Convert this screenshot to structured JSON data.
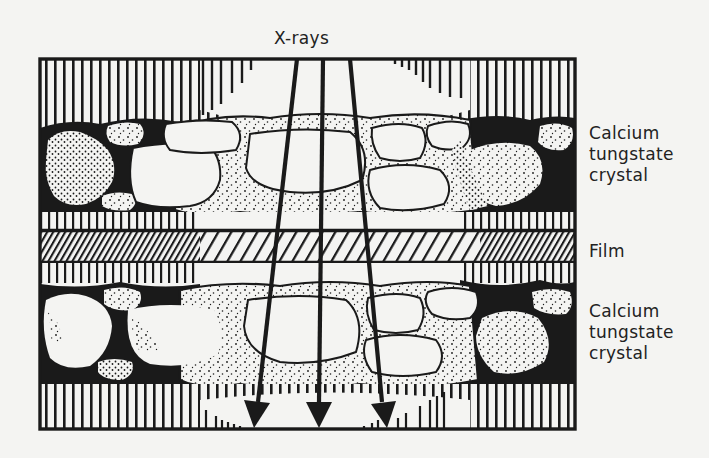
{
  "diagram": {
    "title": "X-rays",
    "labels": {
      "top_crystal": [
        "Calcium",
        "tungstate",
        "crystal"
      ],
      "film": "Film",
      "bottom_crystal": [
        "Calcium",
        "tungstate",
        "crystal"
      ]
    },
    "colors": {
      "ink": "#1a1a1a",
      "paper": "#f4f4f2",
      "crystal_fill": "#f4f4f2",
      "binder": "#1a1a1a"
    },
    "layers": [
      {
        "name": "top-screen-base",
        "pattern": "vertical-lines"
      },
      {
        "name": "top-phosphor-layer",
        "content": "Calcium tungstate crystal"
      },
      {
        "name": "top-thin-layer",
        "pattern": "vertical-lines"
      },
      {
        "name": "film",
        "pattern": "diagonal-hatch",
        "content": "Film"
      },
      {
        "name": "bottom-thin-layer",
        "pattern": "vertical-lines"
      },
      {
        "name": "bottom-phosphor-layer",
        "content": "Calcium tungstate crystal"
      },
      {
        "name": "bottom-screen-base",
        "pattern": "vertical-lines"
      }
    ],
    "arrows": [
      {
        "name": "xray-arrow-left",
        "x1": 297,
        "y1": 58,
        "x2": 255,
        "y2": 428
      },
      {
        "name": "xray-arrow-center",
        "x1": 323,
        "y1": 58,
        "x2": 318,
        "y2": 428
      },
      {
        "name": "xray-arrow-right",
        "x1": 350,
        "y1": 58,
        "x2": 386,
        "y2": 428
      }
    ]
  }
}
